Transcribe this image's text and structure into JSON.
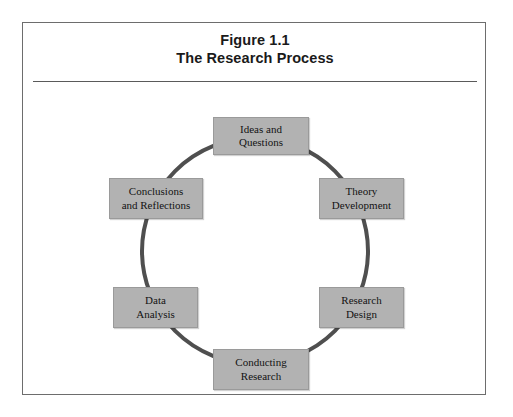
{
  "figure": {
    "title_line1": "Figure 1.1",
    "title_line2": "The Research Process",
    "frame_color": "#6d6d6d",
    "rule_color": "#5a5a5a",
    "background": "#ffffff"
  },
  "diagram": {
    "type": "cycle",
    "direction": "clockwise",
    "ring_color": "#4f4f4f",
    "ring_width_px": 4,
    "box_fill": "#b2b2b2",
    "box_border": "#9a9a9a",
    "text_color": "#121212",
    "stage_count": 6,
    "stages": [
      {
        "id": "ideas-and-questions",
        "position": "top",
        "angle_deg": 90,
        "line1": "Ideas and",
        "line2": "Questions"
      },
      {
        "id": "theory-development",
        "position": "upper-right",
        "angle_deg": 30,
        "line1": "Theory",
        "line2": "Development"
      },
      {
        "id": "research-design",
        "position": "lower-right",
        "angle_deg": 330,
        "line1": "Research",
        "line2": "Design"
      },
      {
        "id": "conducting-research",
        "position": "bottom",
        "angle_deg": 270,
        "line1": "Conducting",
        "line2": "Research"
      },
      {
        "id": "data-analysis",
        "position": "lower-left",
        "angle_deg": 210,
        "line1": "Data",
        "line2": "Analysis"
      },
      {
        "id": "conclusions-and-reflections",
        "position": "upper-left",
        "angle_deg": 150,
        "line1": "Conclusions",
        "line2": "and Reflections"
      }
    ]
  }
}
